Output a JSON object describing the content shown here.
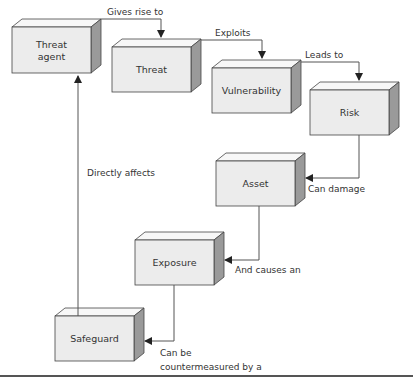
{
  "diagram": {
    "nodes": {
      "threat_agent": {
        "label": [
          "Threat",
          "agent"
        ]
      },
      "threat": {
        "label": [
          "Threat"
        ]
      },
      "vulnerability": {
        "label": [
          "Vulnerability"
        ]
      },
      "risk": {
        "label": [
          "Risk"
        ]
      },
      "asset": {
        "label": [
          "Asset"
        ]
      },
      "exposure": {
        "label": [
          "Exposure"
        ]
      },
      "safeguard": {
        "label": [
          "Safeguard"
        ]
      }
    },
    "edges": {
      "gives_rise_to": {
        "label": [
          "Gives rise to"
        ]
      },
      "exploits": {
        "label": [
          "Exploits"
        ]
      },
      "leads_to": {
        "label": [
          "Leads to"
        ]
      },
      "can_damage": {
        "label": [
          "Can damage"
        ]
      },
      "and_causes_an": {
        "label": [
          "And causes an"
        ]
      },
      "can_be_countermeasured": {
        "label": [
          "Can be",
          "countermeasured by a"
        ]
      },
      "directly_affects": {
        "label": [
          "Directly affects"
        ]
      }
    },
    "colors": {
      "face": "#ececec",
      "top": "#f7f7f7",
      "side": "#9a9a9a",
      "stroke": "#444444",
      "line": "#555555"
    }
  }
}
